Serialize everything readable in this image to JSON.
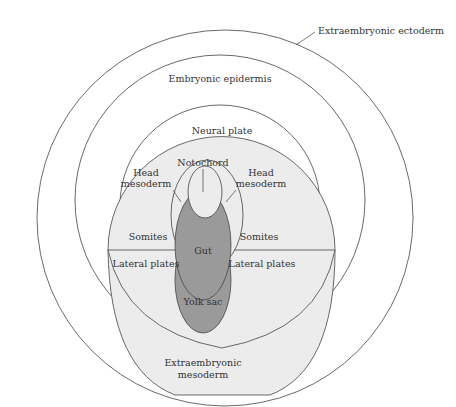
{
  "diagram": {
    "type": "embryonic fate map (concentric regions)",
    "colors": {
      "background": "#ffffff",
      "outline": "#444444",
      "light_fill": "#ececec",
      "dark_fill": "#9a9a9a",
      "text": "#333333"
    },
    "labels": {
      "extraembryonic_ectoderm": "Extraembryonic ectoderm",
      "embryonic_epidermis": "Embryonic epidermis",
      "neural_plate": "Neural plate",
      "notochord": "Notochord",
      "head_mesoderm_left_1": "Head",
      "head_mesoderm_left_2": "mesoderm",
      "head_mesoderm_right_1": "Head",
      "head_mesoderm_right_2": "mesoderm",
      "somites_left": "Somites",
      "somites_right": "Somites",
      "gut": "Gut",
      "lateral_plates_left": "Lateral plates",
      "lateral_plates_right": "Lateral plates",
      "yolk_sac": "Yolk sac",
      "extraembryonic_mesoderm_1": "Extraembryonic",
      "extraembryonic_mesoderm_2": "mesoderm"
    }
  }
}
